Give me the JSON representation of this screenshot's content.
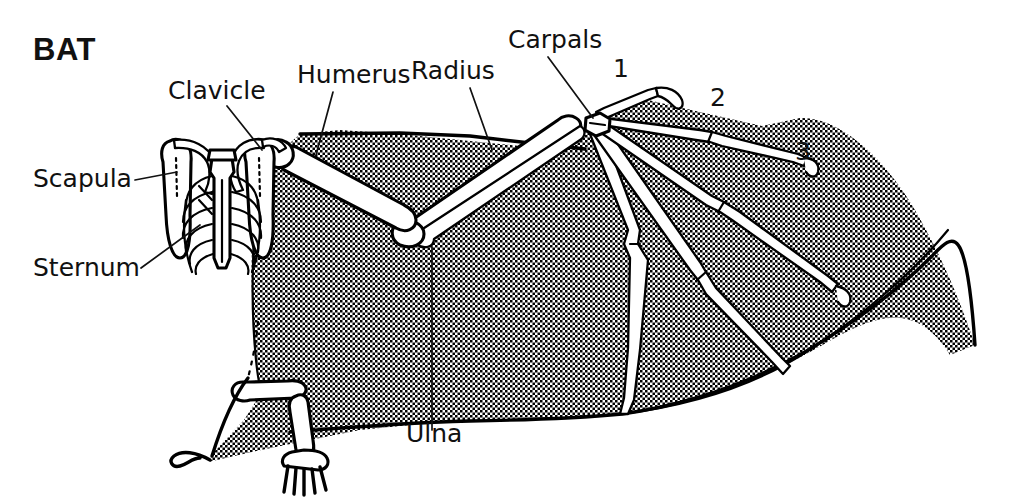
{
  "figure": {
    "title": "BAT",
    "background_color": "#ffffff",
    "ink_color": "#000000",
    "text_color": "#111111"
  },
  "labels": [
    {
      "id": "clavicle",
      "text": "Clavicle",
      "x": 168,
      "y": 99,
      "anchor": "start"
    },
    {
      "id": "humerus",
      "text": "Humerus",
      "x": 297,
      "y": 83,
      "anchor": "start"
    },
    {
      "id": "radius",
      "text": "Radius",
      "x": 411,
      "y": 79,
      "anchor": "start"
    },
    {
      "id": "carpals",
      "text": "Carpals",
      "x": 508,
      "y": 48,
      "anchor": "start"
    },
    {
      "id": "scapula",
      "text": "Scapula",
      "x": 33,
      "y": 187,
      "anchor": "start"
    },
    {
      "id": "sternum",
      "text": "Sternum",
      "x": 33,
      "y": 276,
      "anchor": "start"
    },
    {
      "id": "ulna",
      "text": "Ulna",
      "x": 406,
      "y": 442,
      "anchor": "start"
    }
  ],
  "digit_numbers": [
    {
      "id": "digit-1",
      "text": "1",
      "x": 613,
      "y": 77
    },
    {
      "id": "digit-2",
      "text": "2",
      "x": 710,
      "y": 106
    },
    {
      "id": "digit-3",
      "text": "3",
      "x": 795,
      "y": 160
    }
  ],
  "leader_lines": [
    {
      "id": "clavicle-leader",
      "d": "M 227,106 L 262,150"
    },
    {
      "id": "humerus-leader",
      "d": "M 333,92 L 316,155"
    },
    {
      "id": "radius-leader",
      "d": "M 470,88 L 492,150"
    },
    {
      "id": "carpals-leader",
      "d": "M 548,57 L 593,118"
    },
    {
      "id": "scapula-leader",
      "d": "M 135,180 L 177,172"
    },
    {
      "id": "sternum-leader",
      "d": "M 141,268 L 200,225"
    },
    {
      "id": "ulna-leader",
      "d": "M 432,430 L 432,247"
    }
  ]
}
